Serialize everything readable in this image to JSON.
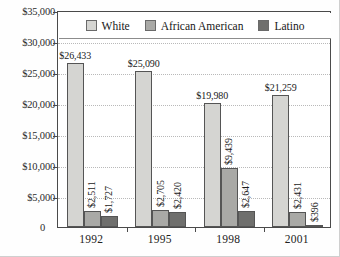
{
  "chart_data": {
    "type": "bar",
    "title": "",
    "subtitle": "",
    "xlabel": "",
    "ylabel": "",
    "categories": [
      "1992",
      "1995",
      "1998",
      "2001"
    ],
    "series": [
      {
        "name": "White",
        "color": "#d5d5d2",
        "values": [
          26433,
          25090,
          19980,
          21259
        ],
        "labels": [
          "$26,433",
          "$25,090",
          "$19,980",
          "$21,259"
        ],
        "label_orientation": [
          "horizontal",
          "horizontal",
          "horizontal",
          "horizontal"
        ]
      },
      {
        "name": "African American",
        "color": "#a9a9a6",
        "values": [
          2511,
          2705,
          9439,
          2431
        ],
        "labels": [
          "$2,511",
          "$2,705",
          "$9,439",
          "$2,431"
        ],
        "label_orientation": [
          "vertical",
          "vertical",
          "vertical",
          "vertical"
        ]
      },
      {
        "name": "Latino",
        "color": "#6f6f6d",
        "values": [
          1727,
          2420,
          2647,
          396
        ],
        "labels": [
          "$1,727",
          "$2,420",
          "$2,647",
          "$396"
        ],
        "label_orientation": [
          "vertical",
          "vertical",
          "vertical",
          "vertical"
        ]
      }
    ],
    "ylim": [
      0,
      35000
    ],
    "ytick_values": [
      0,
      5000,
      10000,
      15000,
      20000,
      25000,
      30000,
      35000
    ],
    "ytick_labels": [
      "0",
      "$5,000",
      "$10,000",
      "$15,000",
      "$20,000",
      "$25,000",
      "$30,000",
      "$35,000"
    ],
    "grid": true,
    "grid_axis": "y",
    "legend_position": "top-inside",
    "legend_entries": [
      "White",
      "African American",
      "Latino"
    ]
  },
  "axis": {
    "y": {
      "ticks": [
        {
          "value": 35000,
          "label": "$35,000"
        },
        {
          "value": 30000,
          "label": "$30,000"
        },
        {
          "value": 25000,
          "label": "$25,000"
        },
        {
          "value": 20000,
          "label": "$20,000"
        },
        {
          "value": 15000,
          "label": "$15,000"
        },
        {
          "value": 10000,
          "label": "$10,000"
        },
        {
          "value": 5000,
          "label": "$5,000"
        }
      ],
      "zero_label": "0"
    },
    "x": {
      "ticks": [
        {
          "label": "1992"
        },
        {
          "label": "1995"
        },
        {
          "label": "1998"
        },
        {
          "label": "2001"
        }
      ]
    }
  },
  "legend": {
    "items": [
      {
        "label": "White",
        "color": "#d5d5d2"
      },
      {
        "label": "African American",
        "color": "#a9a9a6"
      },
      {
        "label": "Latino",
        "color": "#6f6f6d"
      }
    ]
  }
}
